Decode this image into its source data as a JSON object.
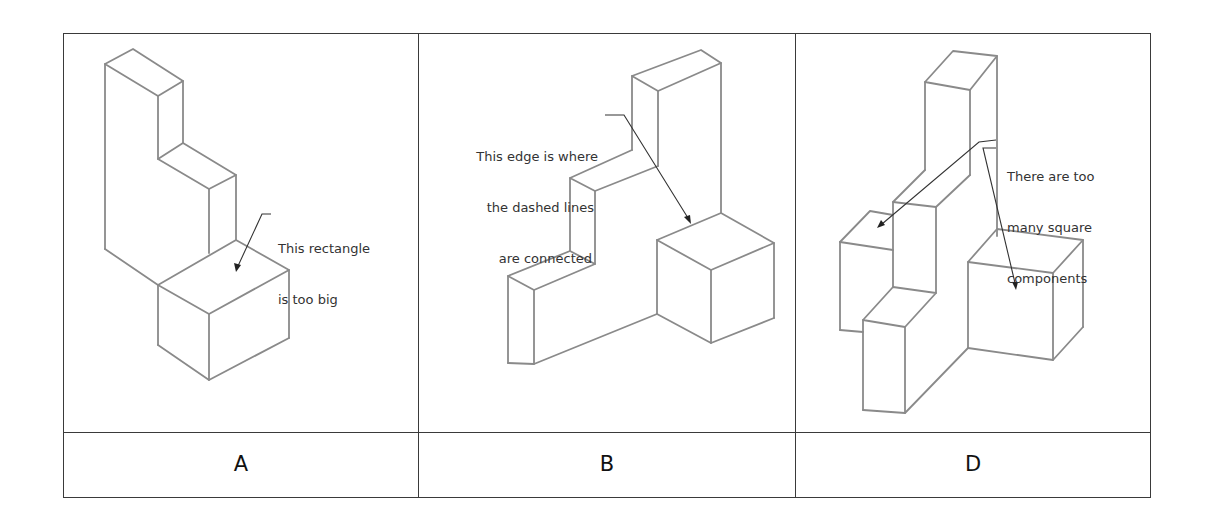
{
  "table": {
    "columns": [
      {
        "label": "A",
        "annotation": [
          "This rectangle",
          "is too big"
        ]
      },
      {
        "label": "B",
        "annotation": [
          "This edge is where",
          "the dashed lines",
          "are connected"
        ]
      },
      {
        "label": "D",
        "annotation": [
          "There are too",
          "many square",
          "components"
        ]
      }
    ]
  },
  "colors": {
    "border": "#3a3a3a",
    "drawing_line": "#8a8a8a",
    "text": "#333333"
  }
}
